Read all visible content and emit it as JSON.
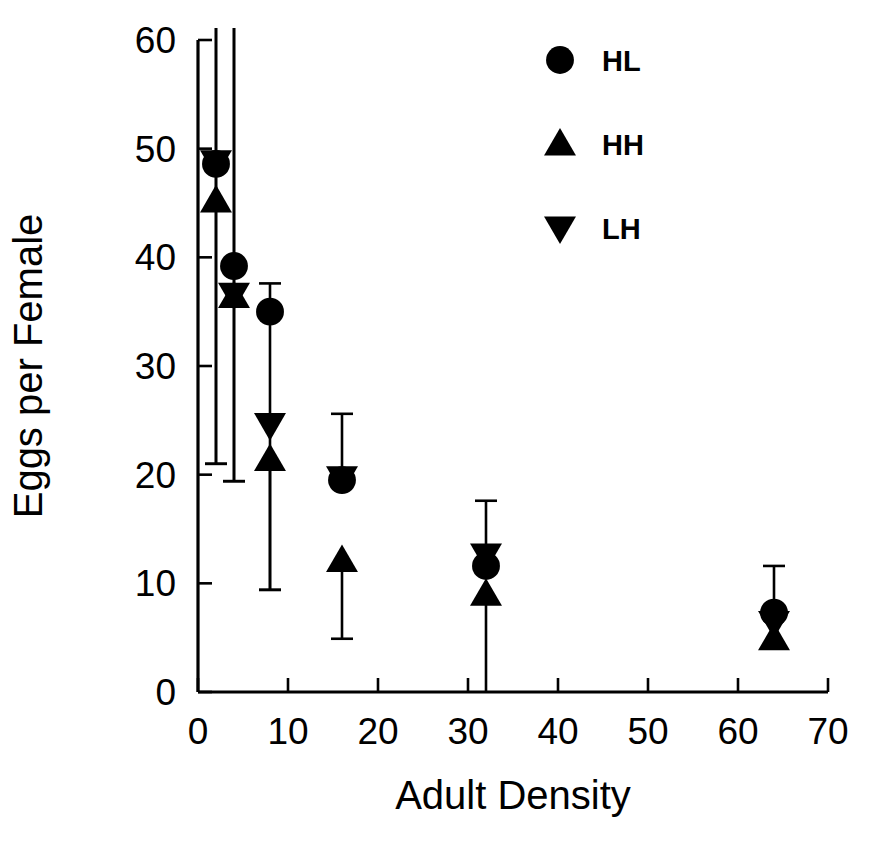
{
  "chart_data": {
    "type": "scatter",
    "title": "",
    "xlabel": "Adult Density",
    "ylabel": "Eggs per Female",
    "xlim": [
      0,
      70
    ],
    "ylim": [
      0,
      60
    ],
    "xticks": [
      0,
      10,
      20,
      30,
      40,
      50,
      60,
      70
    ],
    "yticks": [
      0,
      10,
      20,
      30,
      40,
      50,
      60
    ],
    "xtick_labels": [
      "0",
      "10",
      "20",
      "30",
      "40",
      "50",
      "60",
      "70"
    ],
    "ytick_labels": [
      "0",
      "10",
      "20",
      "30",
      "40",
      "50",
      "60"
    ],
    "grid": false,
    "legend_position": "top-right",
    "marker_color": "#000000",
    "series": [
      {
        "name": "HL",
        "marker": "circle",
        "points": [
          {
            "x": 2,
            "y": 48.6,
            "err_low": 21.0,
            "err_high": 63.5
          },
          {
            "x": 4,
            "y": 39.2,
            "err_low": 19.4,
            "err_high": 62.0
          },
          {
            "x": 8,
            "y": 35.0,
            "err_low": 9.4,
            "err_high": 37.6
          },
          {
            "x": 16,
            "y": 19.5,
            "err_low": 19.5,
            "err_high": 25.6
          },
          {
            "x": 32,
            "y": 11.6,
            "err_low": 11.6,
            "err_high": 17.6
          },
          {
            "x": 64,
            "y": 7.3,
            "err_low": 7.3,
            "err_high": 11.6
          }
        ]
      },
      {
        "name": "HH",
        "marker": "triangle-up",
        "points": [
          {
            "x": 2,
            "y": 45.2,
            "err_low": 21.0,
            "err_high": 63.5
          },
          {
            "x": 4,
            "y": 36.4,
            "err_low": 19.4,
            "err_high": 62.0
          },
          {
            "x": 8,
            "y": 21.4,
            "err_low": 9.4,
            "err_high": 21.4
          },
          {
            "x": 16,
            "y": 12.1,
            "err_low": 4.9,
            "err_high": 12.1
          },
          {
            "x": 32,
            "y": 9.0,
            "err_low": 0.0,
            "err_high": 9.0
          },
          {
            "x": 64,
            "y": 4.9,
            "err_low": 4.9,
            "err_high": 4.9
          }
        ]
      },
      {
        "name": "LH",
        "marker": "triangle-down",
        "points": [
          {
            "x": 2,
            "y": 48.8,
            "err_low": 48.8,
            "err_high": 48.8
          },
          {
            "x": 4,
            "y": 36.6,
            "err_low": 36.6,
            "err_high": 36.6
          },
          {
            "x": 8,
            "y": 24.6,
            "err_low": 24.6,
            "err_high": 24.6
          },
          {
            "x": 16,
            "y": 19.7,
            "err_low": 19.7,
            "err_high": 19.7
          },
          {
            "x": 32,
            "y": 12.6,
            "err_low": 12.6,
            "err_high": 12.6
          },
          {
            "x": 64,
            "y": 6.4,
            "err_low": 6.4,
            "err_high": 6.4
          }
        ]
      }
    ],
    "legend": [
      {
        "label": "HL",
        "marker": "circle"
      },
      {
        "label": "HH",
        "marker": "triangle-up"
      },
      {
        "label": "LH",
        "marker": "triangle-down"
      }
    ]
  }
}
